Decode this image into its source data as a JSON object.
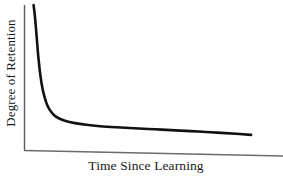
{
  "figure": {
    "background_color": "#ffffff",
    "width": 283,
    "height": 177
  },
  "chart_data": {
    "type": "line",
    "title": "",
    "subtitle": "",
    "xlabel": "Time Since Learning",
    "ylabel": "Degree of Retention",
    "legend": [],
    "legend_position": "none",
    "grid": false,
    "axis_style": {
      "left_spine": true,
      "bottom_spine": true,
      "top_spine": false,
      "right_spine": false,
      "tick_labels": false,
      "tick_marks": false,
      "spine_color": "#5a5a5a"
    },
    "xlim": [
      0,
      1
    ],
    "ylim": [
      0,
      1
    ],
    "xticks": [],
    "yticks": [],
    "xtick_labels": [],
    "ytick_labels": [],
    "series": [
      {
        "name": "Retention",
        "color": "#111111",
        "line_width": 2.6,
        "description": "Ebbinghaus forgetting curve: steep initial decay followed by a long shallow tail",
        "x": [
          0.02,
          0.025,
          0.03,
          0.035,
          0.04,
          0.05,
          0.06,
          0.075,
          0.09,
          0.11,
          0.13,
          0.16,
          0.2,
          0.25,
          0.31,
          0.38,
          0.46,
          0.55,
          0.64,
          0.74,
          0.84,
          0.92,
          0.97
        ],
        "y": [
          1.0,
          0.93,
          0.84,
          0.74,
          0.64,
          0.49,
          0.39,
          0.3,
          0.247,
          0.207,
          0.185,
          0.165,
          0.15,
          0.138,
          0.128,
          0.12,
          0.113,
          0.106,
          0.098,
          0.09,
          0.08,
          0.072,
          0.066
        ]
      }
    ]
  },
  "labels": {
    "y_axis": "Degree of Retention",
    "x_axis": "Time Since Learning"
  }
}
